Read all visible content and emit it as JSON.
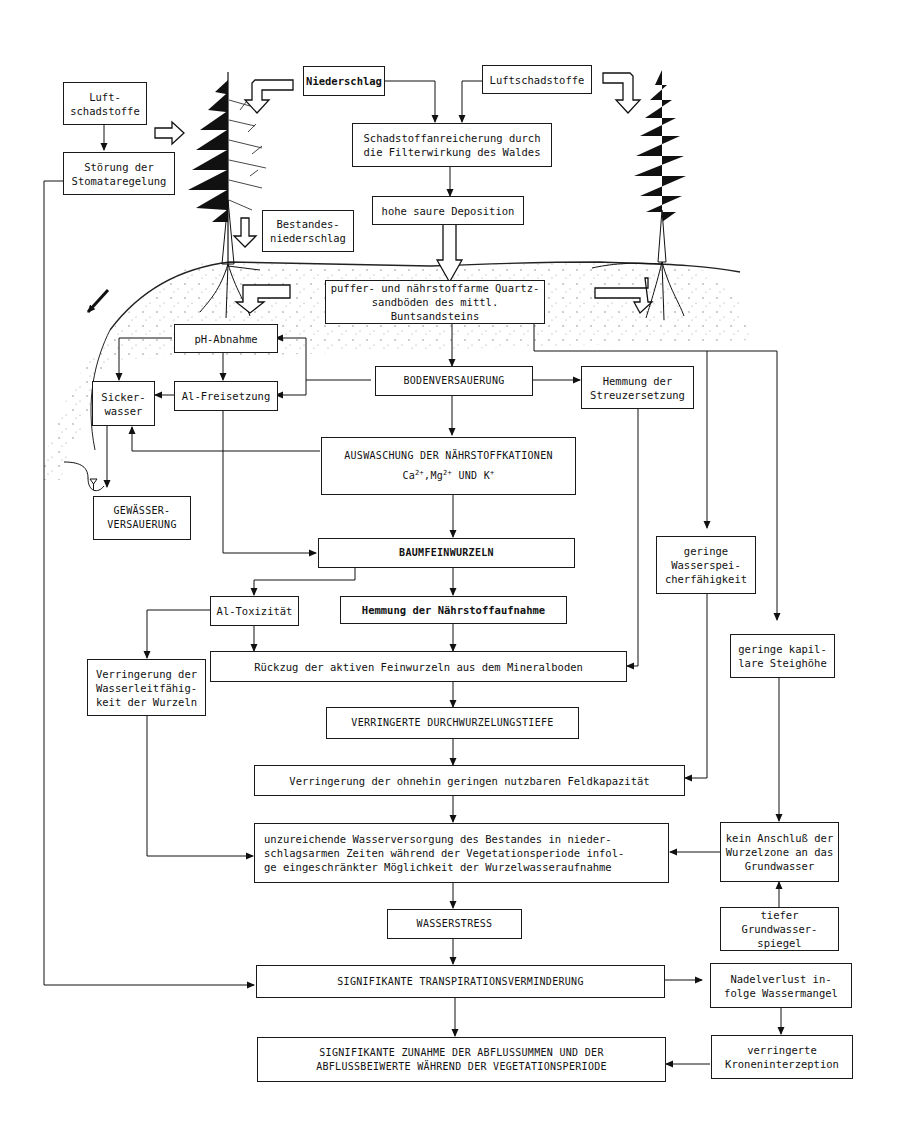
{
  "diagram": {
    "type": "flowchart",
    "language": "de",
    "topic": "Waldschäden / Bodenversauerung und Wasserhaushalt",
    "illustrations": [
      "tree-left-damaged-spruce",
      "tree-right-healthy-spruce",
      "soil-surface",
      "stream-water-symbol"
    ],
    "nodes": {
      "luftschadstoffe_left": "Luft-\nschadstoffe",
      "stoerung_stomata": "Störung der\nStomataregelung",
      "niederschlag": "Niederschlag",
      "luftschadstoffe_top": "Luftschadstoffe",
      "schadstoffanreicherung": "Schadstoffanreicherung durch\ndie Filterwirkung des Waldes",
      "hohe_saure_deposition": "hohe saure Deposition",
      "bestandesniederschlag": "Bestandes-\nniederschlag",
      "quartzsandboeden": "puffer- und nährstoffarme Quartz-\nsandböden des mittl. Buntsandsteins",
      "ph_abnahme": "pH-Abnahme",
      "al_freisetzung": "Al-Freisetzung",
      "sickerwasser": "Sicker-\nwasser",
      "bodenversauerung": "BODENVERSAUERUNG",
      "hemmung_streuzersetzung": "Hemmung der\nStreuzersetzung",
      "auswaschung_line1": "AUSWASCHUNG DER NÄHRSTOFFKATIONEN",
      "auswaschung_ca": "Ca",
      "auswaschung_ca_sup": "2+",
      "auswaschung_mg": ",Mg",
      "auswaschung_mg_sup": "2+",
      "auswaschung_k": " UND K",
      "auswaschung_k_sup": "+",
      "gewaesserversauerung": "GEWÄSSER-\nVERSAUERUNG",
      "baumfeinwurzeln": "BAUMFEINWURZELN",
      "geringe_wasserspeicher": "geringe\nWasserspei-\ncherfähigkeit",
      "al_toxizitaet": "Al-Toxizität",
      "hemmung_naehrstoffaufnahme": "Hemmung der Nährstoffaufnahme",
      "geringe_kapillare": "geringe kapil-\nlare Steighöhe",
      "rueckzug_feinwurzeln": "Rückzug der aktiven Feinwurzeln aus dem Mineralboden",
      "verringerung_wasserleit": "Verringerung der\nWasserleitfähig-\nkeit der Wurzeln",
      "verringerte_durchwurzelung": "VERRINGERTE DURCHWURZELUNGSTIEFE",
      "verringerung_feldkapazitaet": "Verringerung der ohnehin geringen nutzbaren Feldkapazität",
      "unzureichende_wasserversorgung": "unzureichende Wasserversorgung des Bestandes in nieder-\nschlagsarmen Zeiten während der Vegetationsperiode infol-\nge eingeschränkter Möglichkeit der Wurzelwasseraufnahme",
      "kein_anschluss": "kein Anschluß der\nWurzelzone an das\nGrundwasser",
      "wasserstress": "WASSERSTRESS",
      "tiefer_grundwasser": "tiefer Grundwasser-\nspiegel",
      "transpirationsverminderung": "SIGNIFIKANTE TRANSPIRATIONSVERMINDERUNG",
      "nadelverlust": "Nadelverlust in-\nfolge Wassermangel",
      "zunahme_abfluss": "SIGNIFIKANTE ZUNAHME DER ABFLUSSUMMEN UND DER\nABFLUSSBEIWERTE WÄHREND DER VEGETATIONSPERIODE",
      "kroneninterzeption": "verringerte\nKroneninterzeption"
    },
    "edges": [
      [
        "luftschadstoffe_left",
        "stoerung_stomata"
      ],
      [
        "niederschlag",
        "schadstoffanreicherung"
      ],
      [
        "luftschadstoffe_top",
        "schadstoffanreicherung"
      ],
      [
        "schadstoffanreicherung",
        "hohe_saure_deposition"
      ],
      [
        "hohe_saure_deposition",
        "quartzsandboeden"
      ],
      [
        "quartzsandboeden",
        "bodenversauerung"
      ],
      [
        "quartzsandboeden",
        "geringe_wasserspeicher"
      ],
      [
        "quartzsandboeden",
        "geringe_kapillare"
      ],
      [
        "bodenversauerung",
        "ph_abnahme"
      ],
      [
        "bodenversauerung",
        "al_freisetzung"
      ],
      [
        "bodenversauerung",
        "hemmung_streuzersetzung"
      ],
      [
        "bodenversauerung",
        "auswaschung"
      ],
      [
        "ph_abnahme",
        "al_freisetzung"
      ],
      [
        "ph_abnahme",
        "sickerwasser"
      ],
      [
        "al_freisetzung",
        "sickerwasser"
      ],
      [
        "al_freisetzung",
        "baumfeinwurzeln"
      ],
      [
        "auswaschung",
        "sickerwasser"
      ],
      [
        "auswaschung",
        "baumfeinwurzeln"
      ],
      [
        "sickerwasser",
        "gewaesserversauerung"
      ],
      [
        "baumfeinwurzeln",
        "al_toxizitaet"
      ],
      [
        "baumfeinwurzeln",
        "hemmung_naehrstoffaufnahme"
      ],
      [
        "al_toxizitaet",
        "rueckzug_feinwurzeln"
      ],
      [
        "al_toxizitaet",
        "verringerung_wasserleit"
      ],
      [
        "hemmung_naehrstoffaufnahme",
        "rueckzug_feinwurzeln"
      ],
      [
        "hemmung_streuzersetzung",
        "rueckzug_feinwurzeln"
      ],
      [
        "rueckzug_feinwurzeln",
        "verringerte_durchwurzelung"
      ],
      [
        "verringerte_durchwurzelung",
        "verringerung_feldkapazitaet"
      ],
      [
        "geringe_wasserspeicher",
        "verringerung_feldkapazitaet"
      ],
      [
        "verringerung_feldkapazitaet",
        "unzureichende_wasserversorgung"
      ],
      [
        "verringerung_wasserleit",
        "unzureichende_wasserversorgung"
      ],
      [
        "geringe_kapillare",
        "kein_anschluss"
      ],
      [
        "tiefer_grundwasser",
        "kein_anschluss"
      ],
      [
        "kein_anschluss",
        "unzureichende_wasserversorgung"
      ],
      [
        "unzureichende_wasserversorgung",
        "wasserstress"
      ],
      [
        "wasserstress",
        "transpirationsverminderung"
      ],
      [
        "stoerung_stomata",
        "transpirationsverminderung"
      ],
      [
        "transpirationsverminderung",
        "nadelverlust"
      ],
      [
        "transpirationsverminderung",
        "zunahme_abfluss"
      ],
      [
        "nadelverlust",
        "kroneninterzeption"
      ],
      [
        "kroneninterzeption",
        "zunahme_abfluss"
      ]
    ]
  }
}
